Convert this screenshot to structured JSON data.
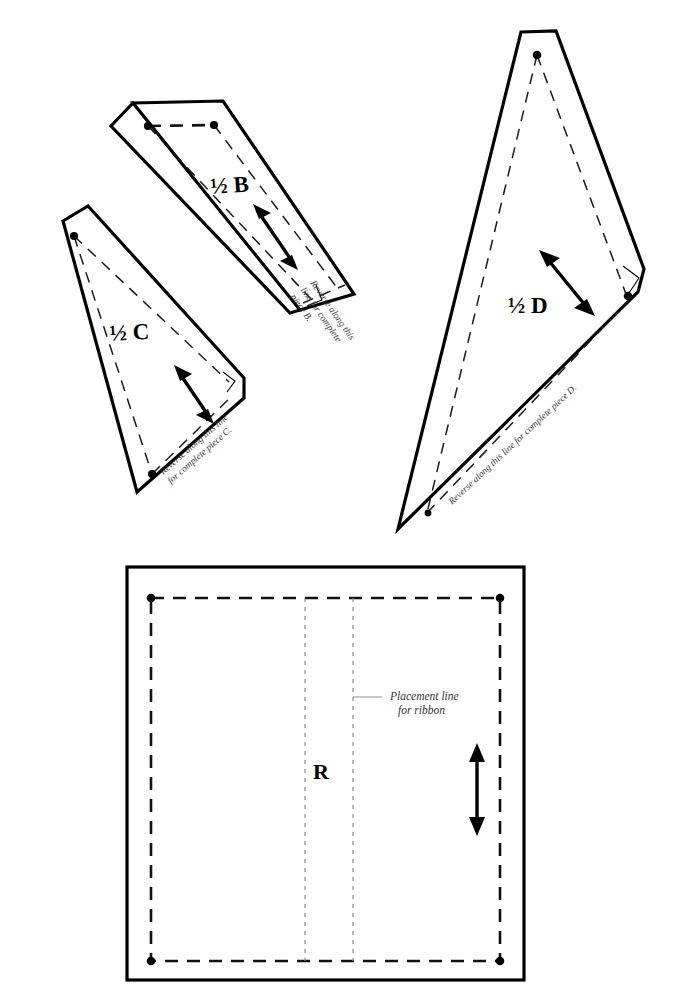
{
  "document": {
    "type": "sewing-pattern-sheet",
    "background_color": "#ffffff",
    "ink_color": "#000000"
  },
  "pieces": [
    {
      "id": "B",
      "label": "½ B",
      "reverse_note_lines": [
        "Reverse along this",
        "line for complete",
        "piece B."
      ],
      "grainline": "double-headed-arrow",
      "shape": "elongated-quadrilateral"
    },
    {
      "id": "C",
      "label": "½ C",
      "reverse_note_lines": [
        "Reverse along this line",
        "for complete piece C."
      ],
      "grainline": "double-headed-arrow",
      "shape": "long-narrow-triangle"
    },
    {
      "id": "D",
      "label": "½ D",
      "reverse_note_lines": [
        "Reverse along this line for complete piece D."
      ],
      "grainline": "double-headed-arrow",
      "shape": "tall-triangle"
    },
    {
      "id": "R",
      "label": "R",
      "ribbon_note_lines": [
        "Placement line",
        "for ribbon"
      ],
      "grainline": "double-headed-arrow",
      "shape": "rectangle"
    }
  ],
  "legend": {
    "cutting_line": "solid heavy line",
    "seam_line": "dashed line",
    "placement_line": "dotted line"
  },
  "colors": {
    "cut_line": "#000000",
    "seam_line": "#1a1a1a",
    "placement_line": "#8c8c8c",
    "paper": "#ffffff"
  }
}
